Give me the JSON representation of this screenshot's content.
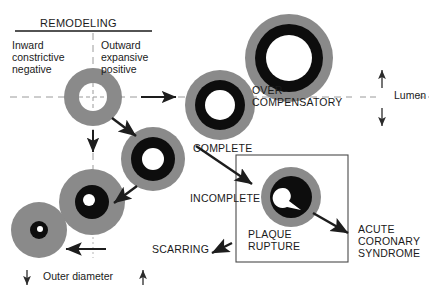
{
  "figure": {
    "title": "REMODELING",
    "quadrant_labels": {
      "left": "Inward\nconstrictive\nnegative",
      "right": "Outward\nexpansive\npositive"
    },
    "axis_labels": {
      "vertical_axis_name": "Lumen",
      "vertical_axis_up_arrow": "↑",
      "vertical_axis_down_arrow": "↓",
      "horizontal_axis_name": "Outer diameter",
      "horizontal_axis_left_arrow": "↓",
      "horizontal_axis_right_arrow": "↑"
    },
    "stages": [
      {
        "id": "complete",
        "label": "COMPLETE"
      },
      {
        "id": "over-compensatory",
        "label": "OVER-\nCOMPENSATORY"
      },
      {
        "id": "incomplete",
        "label": "INCOMPLETE"
      },
      {
        "id": "scarring",
        "label": "SCARRING"
      },
      {
        "id": "plaque-rupture",
        "label": "PLAQUE\nRUPTURE"
      },
      {
        "id": "acute-coronary-syndrome",
        "label": "ACUTE\nCORONARY\nSYNDROME"
      }
    ],
    "colors": {
      "wall_gray": "#8a8a8a",
      "plaque_black": "#0d0d0d",
      "lumen_white": "#ffffff",
      "ink": "#1a1a1a",
      "guide_gray": "#9a9a9a",
      "box_border": "#4a4a4a"
    },
    "vessels": [
      {
        "id": "baseline",
        "cx": 93,
        "cy": 97,
        "r_wall": 29,
        "r_plaque": 0,
        "r_lumen": 14
      },
      {
        "id": "complete",
        "cx": 220,
        "cy": 105,
        "r_wall": 35,
        "r_plaque": 25,
        "r_lumen": 15
      },
      {
        "id": "over-compensatory",
        "cx": 289,
        "cy": 58,
        "r_wall": 44,
        "r_plaque": 34,
        "r_lumen": 23
      },
      {
        "id": "incomplete",
        "cx": 153,
        "cy": 159,
        "r_wall": 32,
        "r_plaque": 22,
        "r_lumen": 11
      },
      {
        "id": "scarring-mid",
        "cx": 92,
        "cy": 202,
        "r_wall": 33,
        "r_plaque": 17,
        "r_lumen": 6
      },
      {
        "id": "scarring-small",
        "cx": 39,
        "cy": 230,
        "r_wall": 28,
        "r_plaque": 9,
        "r_lumen": 3
      },
      {
        "id": "plaque-rupture",
        "cx": 291,
        "cy": 197,
        "r_wall": 30,
        "r_plaque": 21,
        "r_lumen": 12
      }
    ]
  }
}
